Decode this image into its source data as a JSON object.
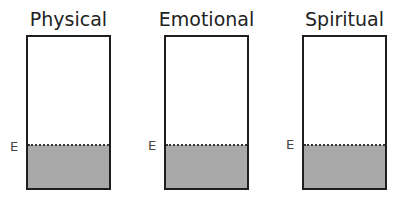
{
  "diagram": {
    "type": "fill-level containers",
    "level_marker_label": "E",
    "fill_color": "#a9a9a9",
    "border_color": "#1e1e1e",
    "containers": [
      {
        "title": "Physical",
        "marker": "E",
        "fill_fraction": 0.3
      },
      {
        "title": "Emotional",
        "marker": "E",
        "fill_fraction": 0.3
      },
      {
        "title": "Spiritual",
        "marker": "E",
        "fill_fraction": 0.3
      }
    ]
  }
}
